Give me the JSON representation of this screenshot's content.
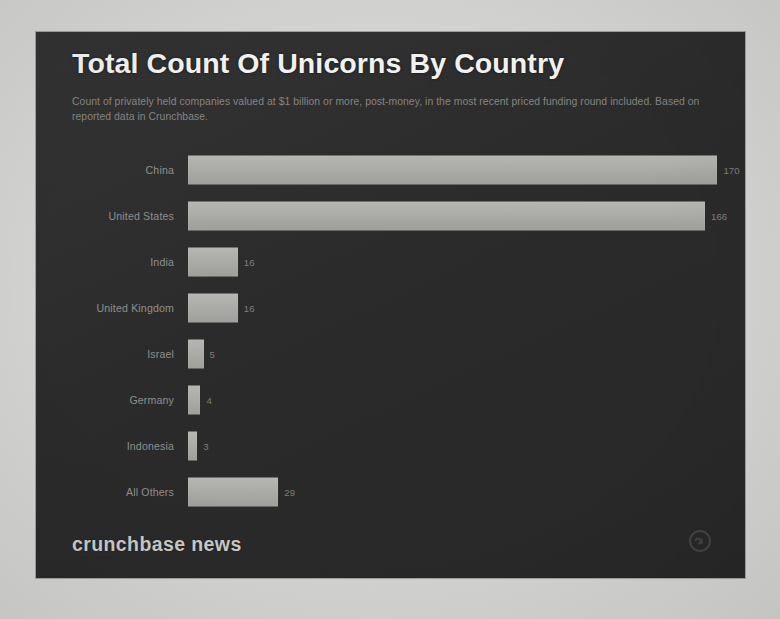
{
  "panel": {
    "background_color": "#2b2b2b",
    "title": "Total Count Of Unicorns By Country",
    "subtitle": "Count of privately held companies valued at $1 billion or more, post-money, in the most recent priced funding round included. Based on reported data in Crunchbase.",
    "footer_logo": "crunchbase news",
    "footer_mark_icon": "crunchbase-logo-icon"
  },
  "chart_data": {
    "type": "bar",
    "orientation": "horizontal",
    "title": "Total Count Of Unicorns By Country",
    "subtitle": "Count of privately held companies valued at $1 billion or more, post-money, in the most recent priced funding round included. Based on reported data in Crunchbase.",
    "xlabel": "",
    "ylabel": "",
    "categories": [
      "China",
      "United States",
      "India",
      "United Kingdom",
      "Israel",
      "Germany",
      "Indonesia",
      "All Others"
    ],
    "values": [
      170,
      166,
      16,
      16,
      5,
      4,
      3,
      29
    ],
    "value_labels": [
      "170",
      "166",
      "16",
      "16",
      "5",
      "4",
      "3",
      "29"
    ],
    "xlim": [
      0,
      175
    ],
    "grid": false,
    "legend": false,
    "bar_color": "#aeaeaa",
    "label_color": "#8f8f8c",
    "title_color": "#f1f1ef",
    "subtitle_color": "#8d8d8a"
  }
}
